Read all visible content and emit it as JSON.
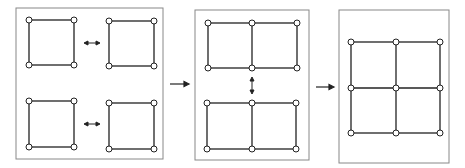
{
  "diagram": {
    "colors": {
      "line": "#222222",
      "border": "#888888",
      "node_fill": "#ffffff"
    },
    "stages": [
      {
        "name": "stage-1",
        "label": "four separate squares joined horizontally"
      },
      {
        "name": "stage-2",
        "label": "two 1x2 rectangles joined vertically"
      },
      {
        "name": "stage-3",
        "label": "final 2x2 grid"
      }
    ],
    "arrows": [
      "right-arrow",
      "right-arrow"
    ]
  }
}
